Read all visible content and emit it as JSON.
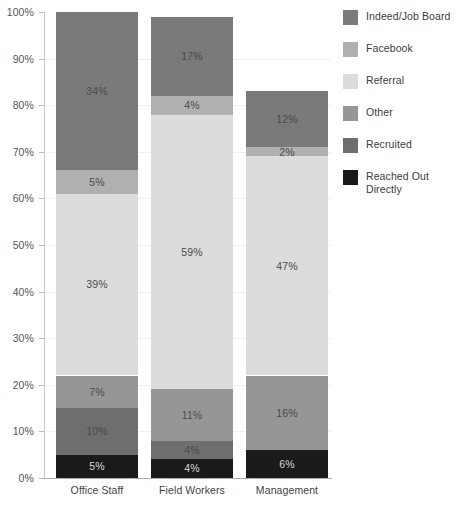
{
  "chart_data": {
    "type": "bar",
    "subtype": "stacked-100-percent",
    "title": "",
    "subtitle": "",
    "xlabel": "",
    "ylabel": "",
    "ylim": [
      0,
      100
    ],
    "grid": true,
    "legend_position": "right",
    "value_suffix": "%",
    "categories": [
      "Office Staff",
      "Field Workers",
      "Management"
    ],
    "y_ticks": [
      "0%",
      "10%",
      "20%",
      "30%",
      "40%",
      "50%",
      "60%",
      "70%",
      "80%",
      "90%",
      "100%"
    ],
    "y_tick_values": [
      0,
      10,
      20,
      30,
      40,
      50,
      60,
      70,
      80,
      90,
      100
    ],
    "stack_order_bottom_to_top": [
      "Reached Out Directly",
      "Recruited",
      "Other",
      "Referral",
      "Facebook",
      "Indeed/Job Board"
    ],
    "series": [
      {
        "name": "Indeed/Job Board",
        "color": "#7a7a7a",
        "values": [
          34,
          17,
          12
        ],
        "labels": [
          "34%",
          "17%",
          "12%"
        ]
      },
      {
        "name": "Facebook",
        "color": "#b0b0b0",
        "values": [
          5,
          4,
          2
        ],
        "labels": [
          "5%",
          "4%",
          "2%"
        ]
      },
      {
        "name": "Referral",
        "color": "#dcdcdc",
        "values": [
          39,
          59,
          47
        ],
        "labels": [
          "39%",
          "59%",
          "47%"
        ]
      },
      {
        "name": "Other",
        "color": "#969696",
        "values": [
          7,
          11,
          16
        ],
        "labels": [
          "7%",
          "11%",
          "16%"
        ]
      },
      {
        "name": "Recruited",
        "color": "#6e6e6e",
        "values": [
          10,
          4,
          0
        ],
        "labels": [
          "10%",
          "4%",
          ""
        ]
      },
      {
        "name": "Reached Out Directly",
        "color": "#1a1a1a",
        "values": [
          5,
          4,
          6
        ],
        "labels": [
          "5%",
          "4%",
          "6%"
        ]
      }
    ]
  },
  "legend": {
    "items": [
      {
        "label": "Indeed/Job Board",
        "color": "#7a7a7a"
      },
      {
        "label": "Facebook",
        "color": "#b0b0b0"
      },
      {
        "label": "Referral",
        "color": "#dcdcdc"
      },
      {
        "label": "Other",
        "color": "#969696"
      },
      {
        "label": "Recruited",
        "color": "#6e6e6e"
      },
      {
        "label": "Reached Out Directly",
        "color": "#1a1a1a"
      }
    ]
  },
  "axes": {
    "y_labels": [
      "100%",
      "90%",
      "80%",
      "70%",
      "60%",
      "50%",
      "40%",
      "30%",
      "20%",
      "10%",
      "0%"
    ],
    "x_labels": [
      "Office Staff",
      "Field Workers",
      "Management"
    ]
  }
}
